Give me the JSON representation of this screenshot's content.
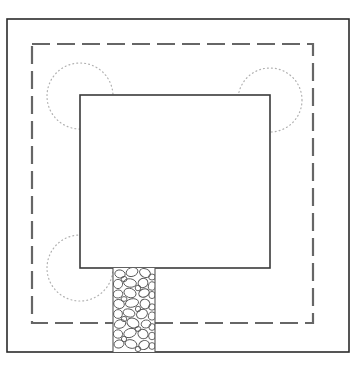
{
  "document": {
    "title": "Site Plan Drawing",
    "type": "architectural-site-plan",
    "canvas": {
      "width": 364,
      "height": 375
    },
    "background_color": "#ffffff"
  },
  "colors": {
    "property_boundary": "#2b2b2b",
    "setback_line": "#666666",
    "building_outline": "#3a3a3a",
    "shrub_symbol": "#b0b0b0",
    "paving_outline": "#555555",
    "paving_fill": "#ffffff"
  },
  "elements": {
    "property_boundary": {
      "label": "Property Boundary",
      "style": "solid",
      "stroke_width": 1.6,
      "x": 7,
      "y": 19,
      "width": 342,
      "height": 333
    },
    "setback_line": {
      "label": "Setback / Easement Line",
      "style": "dashed",
      "stroke_width": 2.2,
      "dash": "18 7",
      "x": 32,
      "y": 44,
      "width": 281,
      "height": 279
    },
    "building_footprint": {
      "label": "Building Footprint",
      "style": "solid",
      "stroke_width": 1.6,
      "x": 80,
      "y": 95,
      "width": 190,
      "height": 173
    },
    "walkway": {
      "label": "Cobblestone Walkway",
      "pattern": "stone-paving",
      "x": 113,
      "y": 268,
      "width": 42,
      "height": 84
    },
    "shrubs": [
      {
        "label": "Shrub North West",
        "cx": 80,
        "cy": 96,
        "r": 33,
        "style": "dotted"
      },
      {
        "label": "Shrub North East",
        "cx": 270,
        "cy": 100,
        "r": 32,
        "style": "dotted"
      },
      {
        "label": "Shrub South West",
        "cx": 80,
        "cy": 268,
        "r": 33,
        "style": "dotted"
      }
    ]
  },
  "stones": [
    {
      "cx": 120,
      "cy": 274,
      "rx": 5.2,
      "ry": 4.0,
      "rot": 12
    },
    {
      "cx": 132,
      "cy": 272,
      "rx": 6.0,
      "ry": 4.4,
      "rot": -18
    },
    {
      "cx": 145,
      "cy": 273,
      "rx": 5.6,
      "ry": 4.2,
      "rot": 25
    },
    {
      "cx": 152,
      "cy": 277,
      "rx": 3.4,
      "ry": 3.0,
      "rot": 0
    },
    {
      "cx": 118,
      "cy": 284,
      "rx": 4.6,
      "ry": 4.6,
      "rot": 0
    },
    {
      "cx": 130,
      "cy": 283,
      "rx": 6.4,
      "ry": 4.2,
      "rot": 8
    },
    {
      "cx": 143,
      "cy": 283,
      "rx": 5.0,
      "ry": 4.6,
      "rot": -30
    },
    {
      "cx": 152,
      "cy": 286,
      "rx": 3.6,
      "ry": 4.2,
      "rot": 15
    },
    {
      "cx": 118,
      "cy": 294,
      "rx": 4.8,
      "ry": 4.0,
      "rot": -10
    },
    {
      "cx": 130,
      "cy": 293,
      "rx": 6.2,
      "ry": 4.6,
      "rot": 20
    },
    {
      "cx": 144,
      "cy": 293,
      "rx": 5.4,
      "ry": 4.0,
      "rot": -22
    },
    {
      "cx": 152,
      "cy": 295,
      "rx": 3.2,
      "ry": 3.6,
      "rot": 0
    },
    {
      "cx": 119,
      "cy": 304,
      "rx": 5.4,
      "ry": 4.4,
      "rot": 18
    },
    {
      "cx": 132,
      "cy": 303,
      "rx": 6.6,
      "ry": 4.2,
      "rot": -12
    },
    {
      "cx": 145,
      "cy": 304,
      "rx": 5.0,
      "ry": 4.8,
      "rot": 30
    },
    {
      "cx": 152,
      "cy": 307,
      "rx": 3.4,
      "ry": 3.2,
      "rot": 0
    },
    {
      "cx": 118,
      "cy": 314,
      "rx": 4.4,
      "ry": 4.4,
      "rot": 0
    },
    {
      "cx": 129,
      "cy": 313,
      "rx": 6.0,
      "ry": 4.0,
      "rot": 14
    },
    {
      "cx": 142,
      "cy": 314,
      "rx": 5.6,
      "ry": 4.6,
      "rot": -26
    },
    {
      "cx": 152,
      "cy": 316,
      "rx": 3.6,
      "ry": 4.0,
      "rot": 10
    },
    {
      "cx": 120,
      "cy": 324,
      "rx": 5.8,
      "ry": 4.2,
      "rot": -16
    },
    {
      "cx": 133,
      "cy": 323,
      "rx": 6.2,
      "ry": 4.8,
      "rot": 22
    },
    {
      "cx": 146,
      "cy": 324,
      "rx": 4.8,
      "ry": 4.0,
      "rot": -8
    },
    {
      "cx": 152,
      "cy": 327,
      "rx": 3.2,
      "ry": 3.4,
      "rot": 0
    },
    {
      "cx": 118,
      "cy": 334,
      "rx": 4.6,
      "ry": 4.2,
      "rot": 6
    },
    {
      "cx": 130,
      "cy": 333,
      "rx": 6.4,
      "ry": 4.4,
      "rot": -20
    },
    {
      "cx": 143,
      "cy": 334,
      "rx": 5.2,
      "ry": 4.6,
      "rot": 28
    },
    {
      "cx": 152,
      "cy": 336,
      "rx": 3.4,
      "ry": 3.8,
      "rot": 0
    },
    {
      "cx": 119,
      "cy": 344,
      "rx": 5.0,
      "ry": 4.0,
      "rot": -14
    },
    {
      "cx": 131,
      "cy": 344,
      "rx": 6.0,
      "ry": 4.2,
      "rot": 16
    },
    {
      "cx": 144,
      "cy": 345,
      "rx": 5.4,
      "ry": 4.4,
      "rot": -24
    },
    {
      "cx": 152,
      "cy": 346,
      "rx": 3.2,
      "ry": 3.4,
      "rot": 0
    },
    {
      "cx": 124,
      "cy": 279,
      "rx": 3.0,
      "ry": 2.6,
      "rot": 0
    },
    {
      "cx": 138,
      "cy": 288,
      "rx": 2.8,
      "ry": 2.8,
      "rot": 0
    },
    {
      "cx": 124,
      "cy": 299,
      "rx": 3.0,
      "ry": 2.4,
      "rot": 0
    },
    {
      "cx": 138,
      "cy": 309,
      "rx": 2.6,
      "ry": 2.8,
      "rot": 0
    },
    {
      "cx": 124,
      "cy": 319,
      "rx": 2.8,
      "ry": 2.6,
      "rot": 0
    },
    {
      "cx": 138,
      "cy": 329,
      "rx": 3.0,
      "ry": 2.4,
      "rot": 0
    },
    {
      "cx": 124,
      "cy": 339,
      "rx": 2.6,
      "ry": 2.8,
      "rot": 0
    },
    {
      "cx": 138,
      "cy": 349,
      "rx": 2.8,
      "ry": 2.6,
      "rot": 0
    }
  ]
}
